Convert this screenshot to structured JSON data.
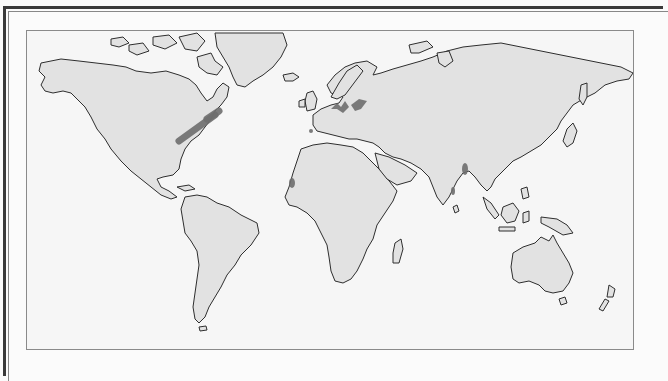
{
  "map": {
    "title": "World map: areas of conflict",
    "colors": {
      "land": "#e2e2e2",
      "coastline": "#2e2e2e",
      "conflict": "#6e6e6e",
      "ocean": "#f6f6f6"
    },
    "conflict_areas": [
      {
        "name": "north-america-east",
        "label": "Eastern North America (Great Lakes to St. Lawrence)"
      },
      {
        "name": "northern-europe",
        "label": "Northern Europe / Baltic"
      },
      {
        "name": "iberia",
        "label": "Iberian Peninsula"
      },
      {
        "name": "west-africa",
        "label": "West African coast (Senegal)"
      },
      {
        "name": "south-asia",
        "label": "Bengal / Himalayan region"
      },
      {
        "name": "india-west",
        "label": "Western India coast"
      }
    ]
  },
  "legend": {
    "label": "Areas of conflict",
    "swatch_color": "#6e6e6e"
  }
}
